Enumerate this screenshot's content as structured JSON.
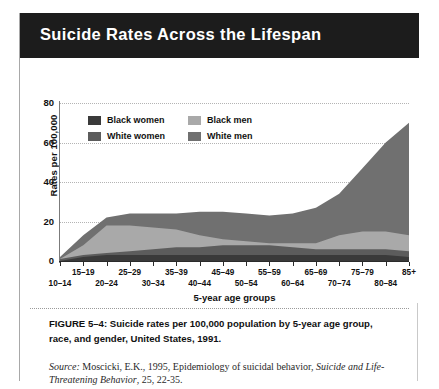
{
  "header": {
    "title": "Suicide Rates Across the Lifespan"
  },
  "caption": {
    "line1": "FIGURE 5–4: Suicide rates per 100,000 population by 5-year age group,",
    "line2": "race, and gender, United States, 1991."
  },
  "source": {
    "label": "Source:",
    "part1": " Moscicki, E.K., 1995, Epidemiology of suicidal behavior, ",
    "journal": "Suicide and Life-Threatening Behavior",
    "part2": ", 25, 22-35."
  },
  "chart_data": {
    "type": "area",
    "title": "Suicide Rates Across the Lifespan",
    "xlabel": "5-year age groups",
    "ylabel": "Rates per 100,000",
    "ylim": [
      0,
      80
    ],
    "yticks": [
      0,
      20,
      40,
      60,
      80
    ],
    "grid": true,
    "legend_position": "top-left-inside",
    "categories": [
      "10–14",
      "15–19",
      "20–24",
      "25–29",
      "30–34",
      "35–39",
      "40–44",
      "45–49",
      "50–54",
      "55–59",
      "60–64",
      "65–69",
      "70–74",
      "75–79",
      "80–84",
      "85+"
    ],
    "series": [
      {
        "name": "White men",
        "color": "#707070",
        "values": [
          2,
          13,
          22,
          24,
          24,
          24,
          25,
          25,
          24,
          23,
          24,
          27,
          34,
          47,
          60,
          70
        ]
      },
      {
        "name": "Black men",
        "color": "#a9a9a9",
        "values": [
          1,
          8,
          18,
          18,
          17,
          16,
          13,
          11,
          10,
          9,
          9,
          9,
          13,
          15,
          15,
          13
        ]
      },
      {
        "name": "White women",
        "color": "#5c5c5c",
        "values": [
          1,
          3,
          4,
          5,
          6,
          7,
          7,
          8,
          8,
          8,
          7,
          6,
          6,
          6,
          6,
          5
        ]
      },
      {
        "name": "Black women",
        "color": "#3a3a3a",
        "values": [
          0,
          2,
          3,
          3,
          3,
          3,
          3,
          3,
          3,
          3,
          3,
          3,
          3,
          3,
          3,
          2
        ]
      }
    ]
  },
  "legend": {
    "entries": [
      {
        "label": "Black women",
        "color": "#3a3a3a"
      },
      {
        "label": "Black men",
        "color": "#a9a9a9"
      },
      {
        "label": "White women",
        "color": "#5c5c5c"
      },
      {
        "label": "White men",
        "color": "#707070"
      }
    ]
  }
}
